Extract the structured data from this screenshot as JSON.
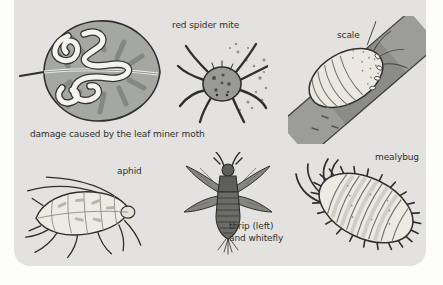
{
  "colors": {
    "page_bg": "#fdfdfc",
    "panel_bg": "#e3e2e0",
    "ink": "#2f2f2d",
    "leaf_fill": "#a5a7a1",
    "leaf_streak": "#7e807a",
    "mine_trail": "#f4f3ee",
    "branch_fill": "#9c9d98",
    "branch_shadow": "#8b8c86",
    "pale_body": "#ebe8e1",
    "thrip_body": "#5e5f5a"
  },
  "figures": {
    "leaf_miner_damage": {
      "caption": "damage caused by the leaf miner moth"
    },
    "red_spider_mite": {
      "caption": "red spider mite"
    },
    "scale": {
      "caption": "scale"
    },
    "aphid": {
      "caption": "aphid"
    },
    "thrip_whitefly": {
      "caption_line1": "thrip (left)",
      "caption_line2": "and whitefly"
    },
    "mealybug": {
      "caption": "mealybug"
    }
  }
}
